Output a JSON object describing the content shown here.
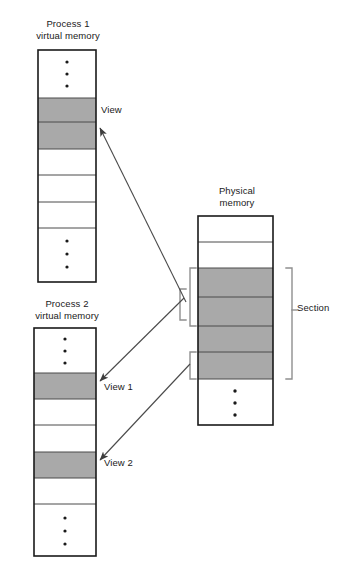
{
  "diagram": {
    "title_semantic": "shared-memory-section-views",
    "colors": {
      "shaded_block": "#a9a9a9",
      "outline": "#1a1a1a",
      "inner_rule": "#4d4d4d",
      "bracket": "#8c8c8c",
      "arrow": "#5a5a5a",
      "background": "#ffffff"
    },
    "ellipsis_glyph": "vertical-ellipsis"
  },
  "process1": {
    "caption": "Process 1\nvirtual memory",
    "box": {
      "x": 38,
      "y": 50,
      "width": 58,
      "height": 232
    },
    "blocks": [
      {
        "name": "ellipsis-top",
        "y": 50,
        "height": 48,
        "shaded": false,
        "ellipsis": true
      },
      {
        "name": "view-block-a",
        "y": 98,
        "height": 24,
        "shaded": true,
        "ellipsis": false
      },
      {
        "name": "view-block-b",
        "y": 122,
        "height": 27,
        "shaded": true,
        "ellipsis": false
      },
      {
        "name": "free-block-1",
        "y": 149,
        "height": 26,
        "shaded": false,
        "ellipsis": false
      },
      {
        "name": "free-block-2",
        "y": 175,
        "height": 27,
        "shaded": false,
        "ellipsis": false
      },
      {
        "name": "free-block-3",
        "y": 202,
        "height": 26,
        "shaded": false,
        "ellipsis": false
      },
      {
        "name": "ellipsis-bottom",
        "y": 228,
        "height": 54,
        "shaded": false,
        "ellipsis": true
      }
    ],
    "view_label": "View"
  },
  "process2": {
    "caption": "Process 2\nvirtual memory",
    "box": {
      "x": 34,
      "y": 328,
      "width": 62,
      "height": 228
    },
    "blocks": [
      {
        "name": "ellipsis-top",
        "y": 328,
        "height": 45,
        "shaded": false,
        "ellipsis": true
      },
      {
        "name": "view1-block",
        "y": 373,
        "height": 26,
        "shaded": true,
        "ellipsis": false
      },
      {
        "name": "free-block-1",
        "y": 399,
        "height": 26,
        "shaded": false,
        "ellipsis": false
      },
      {
        "name": "free-block-2",
        "y": 425,
        "height": 27,
        "shaded": false,
        "ellipsis": false
      },
      {
        "name": "view2-block",
        "y": 452,
        "height": 26,
        "shaded": true,
        "ellipsis": false
      },
      {
        "name": "free-block-3",
        "y": 478,
        "height": 26,
        "shaded": false,
        "ellipsis": false
      },
      {
        "name": "ellipsis-bottom",
        "y": 504,
        "height": 52,
        "shaded": false,
        "ellipsis": true
      }
    ],
    "view1_label": "View 1",
    "view2_label": "View 2"
  },
  "physical": {
    "caption": "Physical\nmemory",
    "box": {
      "x": 198,
      "y": 216,
      "width": 75,
      "height": 209
    },
    "blocks": [
      {
        "name": "free-block-top",
        "y": 216,
        "height": 26,
        "shaded": false,
        "ellipsis": false
      },
      {
        "name": "free-block-2",
        "y": 242,
        "height": 26,
        "shaded": false,
        "ellipsis": false
      },
      {
        "name": "section-block-1",
        "y": 268,
        "height": 29,
        "shaded": true,
        "ellipsis": false
      },
      {
        "name": "section-block-2",
        "y": 297,
        "height": 29,
        "shaded": true,
        "ellipsis": false
      },
      {
        "name": "section-block-3",
        "y": 326,
        "height": 26,
        "shaded": true,
        "ellipsis": false
      },
      {
        "name": "section-block-4",
        "y": 352,
        "height": 27,
        "shaded": true,
        "ellipsis": false
      },
      {
        "name": "ellipsis-bottom",
        "y": 379,
        "height": 46,
        "shaded": false,
        "ellipsis": true
      }
    ],
    "section_label": "Section",
    "section_bracket": {
      "y_top": 268,
      "y_bottom": 379
    },
    "view1_bracket": {
      "y_top": 268,
      "y_bottom": 326
    },
    "view2_bracket": {
      "y_top": 352,
      "y_bottom": 379
    },
    "merge_bracket": {
      "y_top": 289,
      "y_bottom": 320
    }
  }
}
